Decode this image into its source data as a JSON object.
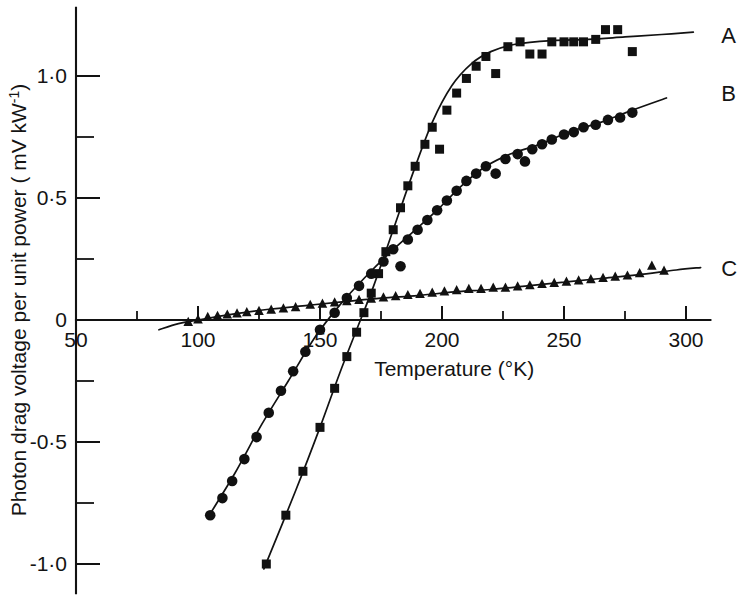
{
  "figure": {
    "background_color": "#ffffff",
    "ink_color": "#121212"
  },
  "chart_data": {
    "type": "scatter",
    "title": "",
    "xlabel": "Temperature (°K)",
    "ylabel": "Photon drag voltage per unit power ( mV kW⁻¹)",
    "xlim": [
      38,
      310
    ],
    "ylim": [
      -1.12,
      1.28
    ],
    "xticks": [
      50,
      100,
      150,
      200,
      250,
      300
    ],
    "xtick_labels": [
      "50",
      "100",
      "150",
      "200",
      "250",
      "300"
    ],
    "x_minor_ticks": [
      75,
      125,
      175,
      225,
      275
    ],
    "yticks": [
      -1.0,
      -0.5,
      0.0,
      0.5,
      1.0
    ],
    "ytick_labels": [
      "-1·0",
      "-0·5",
      "0",
      "0·5",
      "1·0"
    ],
    "y_minor_ticks": [
      -0.75,
      -0.25,
      0.25,
      0.75
    ],
    "grid": false,
    "legend_position": "right-inline-labels",
    "series": [
      {
        "name": "A",
        "label": "A",
        "marker": "square",
        "points": [
          [
            128,
            -1.0
          ],
          [
            136,
            -0.8
          ],
          [
            143,
            -0.62
          ],
          [
            150,
            -0.44
          ],
          [
            156,
            -0.28
          ],
          [
            161,
            -0.15
          ],
          [
            165,
            -0.05
          ],
          [
            168,
            0.03
          ],
          [
            171,
            0.11
          ],
          [
            174,
            0.19
          ],
          [
            177,
            0.28
          ],
          [
            180,
            0.37
          ],
          [
            183,
            0.46
          ],
          [
            186,
            0.55
          ],
          [
            189,
            0.63
          ],
          [
            193,
            0.72
          ],
          [
            196,
            0.79
          ],
          [
            199,
            0.7
          ],
          [
            202,
            0.86
          ],
          [
            206,
            0.93
          ],
          [
            210,
            0.99
          ],
          [
            214,
            1.04
          ],
          [
            218,
            1.08
          ],
          [
            222,
            1.01
          ],
          [
            227,
            1.12
          ],
          [
            232,
            1.14
          ],
          [
            236,
            1.09
          ],
          [
            241,
            1.09
          ],
          [
            245,
            1.14
          ],
          [
            250,
            1.14
          ],
          [
            254,
            1.14
          ],
          [
            258,
            1.14
          ],
          [
            263,
            1.15
          ],
          [
            267,
            1.19
          ],
          [
            272,
            1.19
          ],
          [
            278,
            1.1
          ]
        ]
      },
      {
        "name": "B",
        "label": "B",
        "marker": "circle",
        "points": [
          [
            105,
            -0.8
          ],
          [
            110,
            -0.73
          ],
          [
            114,
            -0.66
          ],
          [
            119,
            -0.57
          ],
          [
            124,
            -0.48
          ],
          [
            129,
            -0.38
          ],
          [
            134,
            -0.29
          ],
          [
            139,
            -0.21
          ],
          [
            144,
            -0.13
          ],
          [
            150,
            -0.04
          ],
          [
            156,
            0.03
          ],
          [
            161,
            0.09
          ],
          [
            166,
            0.14
          ],
          [
            171,
            0.19
          ],
          [
            176,
            0.24
          ],
          [
            180,
            0.29
          ],
          [
            183,
            0.22
          ],
          [
            186,
            0.33
          ],
          [
            190,
            0.37
          ],
          [
            194,
            0.41
          ],
          [
            198,
            0.45
          ],
          [
            202,
            0.49
          ],
          [
            206,
            0.53
          ],
          [
            210,
            0.57
          ],
          [
            214,
            0.6
          ],
          [
            218,
            0.63
          ],
          [
            222,
            0.6
          ],
          [
            226,
            0.66
          ],
          [
            231,
            0.68
          ],
          [
            234,
            0.65
          ],
          [
            237,
            0.7
          ],
          [
            241,
            0.72
          ],
          [
            245,
            0.74
          ],
          [
            250,
            0.76
          ],
          [
            254,
            0.77
          ],
          [
            258,
            0.79
          ],
          [
            263,
            0.8
          ],
          [
            268,
            0.82
          ],
          [
            273,
            0.83
          ],
          [
            278,
            0.85
          ]
        ]
      },
      {
        "name": "C",
        "label": "C",
        "marker": "triangle",
        "points": [
          [
            96,
            -0.01
          ],
          [
            100,
            0.0
          ],
          [
            104,
            0.01
          ],
          [
            108,
            0.015
          ],
          [
            112,
            0.02
          ],
          [
            116,
            0.025
          ],
          [
            120,
            0.03
          ],
          [
            125,
            0.035
          ],
          [
            130,
            0.04
          ],
          [
            135,
            0.045
          ],
          [
            140,
            0.05
          ],
          [
            146,
            0.06
          ],
          [
            151,
            0.065
          ],
          [
            156,
            0.07
          ],
          [
            161,
            0.075
          ],
          [
            166,
            0.08
          ],
          [
            171,
            0.085
          ],
          [
            176,
            0.09
          ],
          [
            181,
            0.095
          ],
          [
            186,
            0.1
          ],
          [
            191,
            0.105
          ],
          [
            196,
            0.11
          ],
          [
            201,
            0.115
          ],
          [
            206,
            0.12
          ],
          [
            211,
            0.125
          ],
          [
            216,
            0.125
          ],
          [
            221,
            0.13
          ],
          [
            226,
            0.13
          ],
          [
            231,
            0.135
          ],
          [
            236,
            0.14
          ],
          [
            241,
            0.145
          ],
          [
            246,
            0.15
          ],
          [
            251,
            0.155
          ],
          [
            256,
            0.16
          ],
          [
            261,
            0.165
          ],
          [
            266,
            0.17
          ],
          [
            271,
            0.175
          ],
          [
            276,
            0.18
          ],
          [
            281,
            0.19
          ],
          [
            286,
            0.22
          ],
          [
            291,
            0.2
          ]
        ]
      }
    ],
    "fit_curves": [
      {
        "name": "A-fit",
        "path": [
          [
            127,
            -1.02
          ],
          [
            140,
            -0.7
          ],
          [
            150,
            -0.44
          ],
          [
            158,
            -0.22
          ],
          [
            165,
            -0.04
          ],
          [
            172,
            0.14
          ],
          [
            180,
            0.37
          ],
          [
            188,
            0.6
          ],
          [
            196,
            0.81
          ],
          [
            204,
            0.96
          ],
          [
            212,
            1.05
          ],
          [
            220,
            1.1
          ],
          [
            230,
            1.13
          ],
          [
            245,
            1.145
          ],
          [
            260,
            1.15
          ],
          [
            275,
            1.16
          ],
          [
            290,
            1.17
          ],
          [
            303,
            1.18
          ]
        ]
      },
      {
        "name": "B-fit",
        "path": [
          [
            104,
            -0.81
          ],
          [
            115,
            -0.63
          ],
          [
            126,
            -0.43
          ],
          [
            137,
            -0.25
          ],
          [
            148,
            -0.07
          ],
          [
            158,
            0.06
          ],
          [
            168,
            0.17
          ],
          [
            178,
            0.27
          ],
          [
            188,
            0.36
          ],
          [
            198,
            0.45
          ],
          [
            208,
            0.55
          ],
          [
            218,
            0.63
          ],
          [
            228,
            0.68
          ],
          [
            240,
            0.72
          ],
          [
            252,
            0.77
          ],
          [
            265,
            0.81
          ],
          [
            278,
            0.86
          ],
          [
            292,
            0.91
          ]
        ]
      },
      {
        "name": "C-fit",
        "path": [
          [
            84,
            -0.04
          ],
          [
            92,
            -0.015
          ],
          [
            100,
            0.0
          ],
          [
            115,
            0.025
          ],
          [
            130,
            0.045
          ],
          [
            145,
            0.06
          ],
          [
            160,
            0.075
          ],
          [
            175,
            0.09
          ],
          [
            190,
            0.1
          ],
          [
            205,
            0.115
          ],
          [
            220,
            0.125
          ],
          [
            235,
            0.14
          ],
          [
            250,
            0.155
          ],
          [
            265,
            0.17
          ],
          [
            280,
            0.185
          ],
          [
            296,
            0.205
          ],
          [
            306,
            0.215
          ]
        ]
      }
    ],
    "curve_labels": [
      {
        "text": "A",
        "x": 312,
        "y": 1.17
      },
      {
        "text": "B",
        "x": 312,
        "y": 0.93
      },
      {
        "text": "C",
        "x": 312,
        "y": 0.215
      }
    ]
  }
}
